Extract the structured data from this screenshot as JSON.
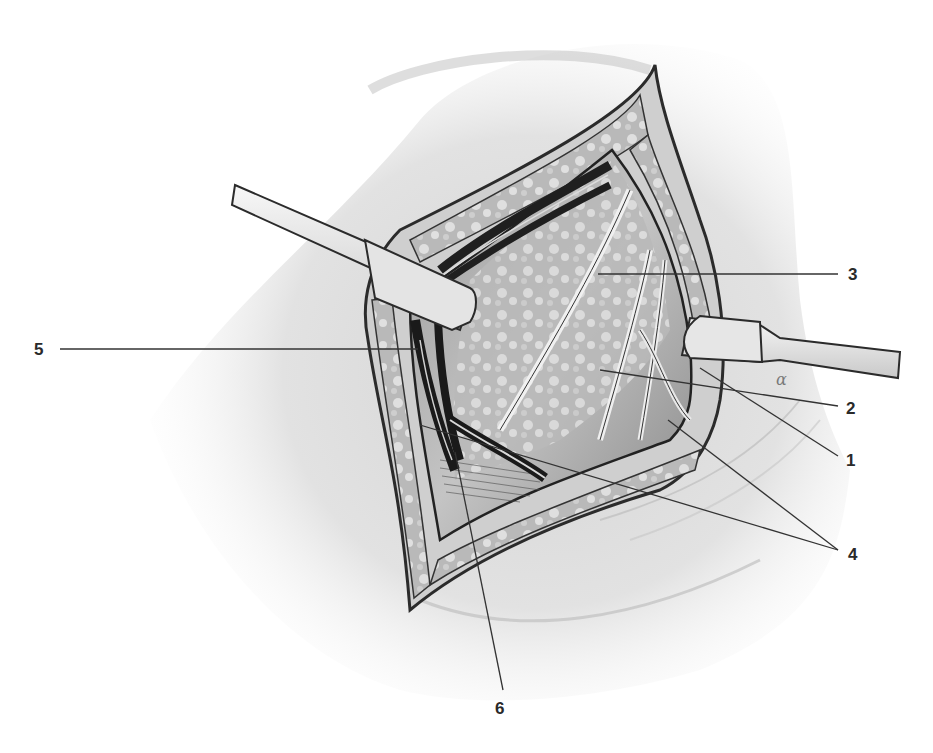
{
  "figure": {
    "type": "surgical anatomical illustration",
    "style": "grayscale pencil/ink rendering",
    "colors": {
      "background": "#ffffff",
      "skin": "#d9d9d9",
      "skin_shadow": "#b8b8b8",
      "wound_edge": "#2b2b2b",
      "vessel_dark": "#1f1f1f",
      "retractor": "#ececec",
      "leader_line": "#333333",
      "label_text": "#2a2a2a"
    }
  },
  "callouts": [
    {
      "id": "1",
      "label": "1",
      "label_pos": [
        846,
        452
      ],
      "lines": [
        [
          700,
          368,
          838,
          456
        ]
      ]
    },
    {
      "id": "2",
      "label": "2",
      "label_pos": [
        846,
        400
      ],
      "lines": [
        [
          600,
          370,
          838,
          406
        ]
      ]
    },
    {
      "id": "3",
      "label": "3",
      "label_pos": [
        848,
        266
      ],
      "lines": [
        [
          598,
          274,
          838,
          274
        ]
      ]
    },
    {
      "id": "4",
      "label": "4",
      "label_pos": [
        848,
        546
      ],
      "lines": [
        [
          668,
          420,
          838,
          550
        ],
        [
          420,
          425,
          838,
          550
        ]
      ]
    },
    {
      "id": "5",
      "label": "5",
      "label_pos": [
        34,
        341
      ],
      "lines": [
        [
          60,
          349,
          418,
          349
        ]
      ]
    },
    {
      "id": "6",
      "label": "6",
      "label_pos": [
        495,
        700
      ],
      "lines": [
        [
          455,
          452,
          503,
          690
        ]
      ]
    }
  ],
  "annotation_mark": "α"
}
